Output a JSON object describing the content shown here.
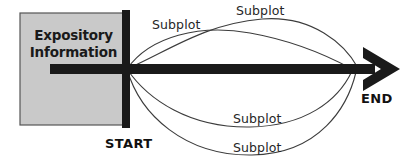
{
  "diagram": {
    "type": "story-arc-plot-diagram",
    "colors": {
      "box_fill": "#c9c9c9",
      "box_stroke": "#555555",
      "main_line": "#1a1a1a",
      "arc_line": "#3c3c3c",
      "text": "#1a1a1a",
      "background": "#ffffff"
    },
    "expository_box": {
      "line1": "Expository",
      "line2": "Information"
    },
    "timeline": {
      "start_label": "START",
      "end_label": "END"
    },
    "subplots": [
      {
        "label": "Subplot",
        "position": "upper-left"
      },
      {
        "label": "Subplot",
        "position": "upper-right"
      },
      {
        "label": "Subplot",
        "position": "lower-inner"
      },
      {
        "label": "Subplot",
        "position": "lower-outer"
      }
    ]
  }
}
